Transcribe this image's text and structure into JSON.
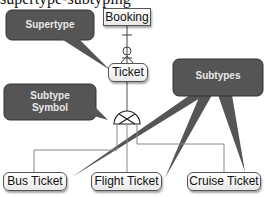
{
  "top_text": "supertype-subtyping",
  "entities": {
    "booking": "Booking",
    "ticket": "Ticket",
    "bus_ticket": "Bus Ticket",
    "flight_ticket": "Flight Ticket",
    "cruise_ticket": "Cruise Ticket"
  },
  "callouts": {
    "supertype": "Supertype",
    "subtype_symbol_line1": "Subtype",
    "subtype_symbol_line2": "Symbol",
    "subtypes": "Subtypes"
  },
  "colors": {
    "callout_fill": "#555555",
    "callout_text": "#e8e8e8",
    "line": "#666666"
  }
}
